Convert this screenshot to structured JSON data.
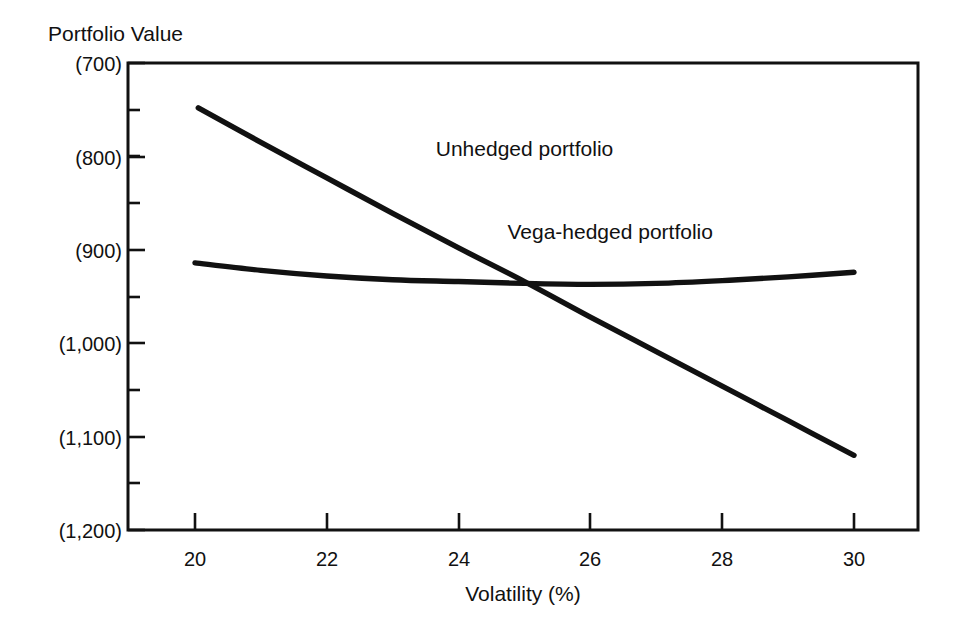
{
  "chart_data": {
    "type": "line",
    "title": "",
    "xlabel": "Volatility (%)",
    "ylabel": "Portfolio Value",
    "xlim": [
      19.2,
      30.95
    ],
    "ylim": [
      1200,
      700
    ],
    "y_axis_inverted": true,
    "y_values_are_parenthesized_negatives": true,
    "grid": false,
    "legend_position": "inline-labels",
    "x_ticks": [
      20,
      22,
      24,
      26,
      28,
      30
    ],
    "x_tick_labels": [
      "20",
      "22",
      "24",
      "26",
      "28",
      "30"
    ],
    "x_minor_ticks": [
      21,
      23,
      25,
      27,
      29
    ],
    "y_ticks": [
      700,
      800,
      900,
      1000,
      1100,
      1200
    ],
    "y_tick_labels": [
      "(700)",
      "(800)",
      "(900)",
      "(1,000)",
      "(1,100)",
      "(1,200)"
    ],
    "y_minor_ticks": [
      750,
      850,
      950,
      1050,
      1150
    ],
    "series": [
      {
        "name": "Unhedged portfolio",
        "label": "Unhedged portfolio",
        "label_x": 25.0,
        "label_y": 800,
        "x": [
          20.05,
          21.0,
          22.0,
          23.0,
          24.0,
          25.0,
          26.0,
          27.0,
          28.0,
          29.0,
          30.0
        ],
        "values": [
          748,
          785,
          823,
          861,
          898,
          934,
          972,
          1009,
          1046,
          1083,
          1120
        ]
      },
      {
        "name": "Vega-hedged portfolio",
        "label": "Vega-hedged portfolio",
        "label_x": 26.3,
        "label_y": 888,
        "x": [
          20.0,
          21.0,
          22.0,
          23.0,
          24.0,
          25.0,
          26.0,
          27.0,
          28.0,
          29.0,
          30.0
        ],
        "values": [
          914,
          922,
          928,
          932,
          934,
          936,
          937,
          936,
          933,
          929,
          924
        ]
      }
    ]
  },
  "labels": {
    "y_axis_title": "Portfolio Value",
    "x_axis_title": "Volatility (%)"
  },
  "colors": {
    "ink": "#111111",
    "background": "#ffffff"
  }
}
